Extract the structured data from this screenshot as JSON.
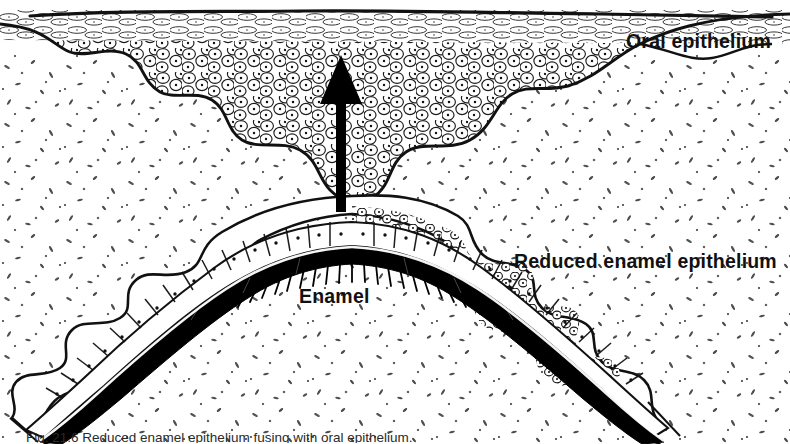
{
  "figure": {
    "kind": "histology-line-drawing",
    "title_visible": false,
    "caption": "Fig. 21.6 Reduced enamel epithelium fusing with oral epithelium.",
    "caption_clipped": true,
    "background_color": "#ffffff",
    "ink_color": "#111111",
    "enamel_fill": "#000000"
  },
  "labels": {
    "oral_epithelium": "Oral epithelium",
    "reduced_enamel_epithelium": "Reduced enamel epithelium",
    "enamel": "Enamel"
  },
  "annotations": {
    "arrow": {
      "name": "eruption-direction-arrow",
      "direction": "up",
      "color": "#000000",
      "x": 341,
      "y_top": 57,
      "y_bottom": 211
    }
  },
  "structures": [
    {
      "id": "oral-surface-line",
      "label": "keratinized oral surface"
    },
    {
      "id": "oral-epithelium-mass",
      "label": "Oral epithelium"
    },
    {
      "id": "connective-tissue",
      "label": "lamina propria / connective tissue stipple"
    },
    {
      "id": "reduced-enamel-epithelium",
      "label": "Reduced enamel epithelium"
    },
    {
      "id": "enamel-band",
      "label": "Enamel"
    }
  ],
  "geometry": {
    "width": 790,
    "height": 444,
    "crown_apex_x": 352,
    "crown_apex_y": 222
  }
}
